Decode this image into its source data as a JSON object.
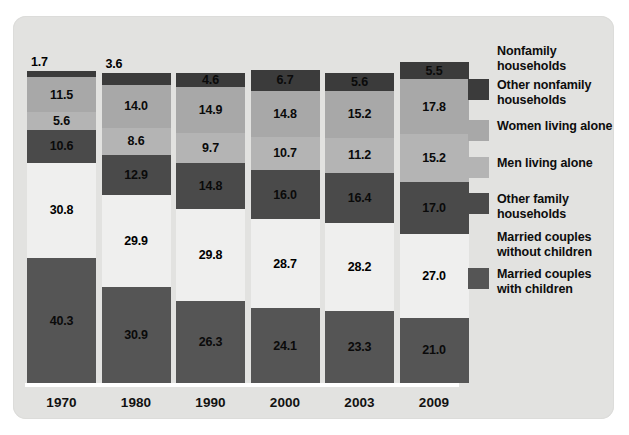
{
  "chart_data": {
    "type": "bar",
    "subtype": "stacked-bar-with-gap",
    "title": "",
    "xlabel": "",
    "ylabel": "",
    "grid": false,
    "legend_position": "right",
    "categories": [
      "1970",
      "1980",
      "1990",
      "2000",
      "2003",
      "2009"
    ],
    "series": [
      {
        "name": "Other nonfamily households",
        "color": "#3b3b3b",
        "values": [
          1.7,
          3.6,
          4.6,
          6.7,
          5.6,
          5.5
        ]
      },
      {
        "name": "Women living alone",
        "color": "#a8a8a8",
        "values": [
          11.5,
          14.0,
          14.9,
          14.8,
          15.2,
          17.8
        ]
      },
      {
        "name": "Men living alone",
        "color": "#b4b4b4",
        "values": [
          5.6,
          8.6,
          9.7,
          10.7,
          11.2,
          15.2
        ]
      },
      {
        "name": "Other family households",
        "color": "#4a4a4a",
        "values": [
          10.6,
          12.9,
          14.8,
          16.0,
          16.4,
          17.0
        ]
      },
      {
        "name": "Married couples without children",
        "color": "#efefee",
        "values": [
          30.8,
          29.9,
          29.8,
          28.7,
          28.2,
          27.0
        ]
      },
      {
        "name": "Married couples with children",
        "color": "#555555",
        "values": [
          40.3,
          30.9,
          26.3,
          24.1,
          23.3,
          21.0
        ]
      }
    ],
    "value_label_format": "one-decimal",
    "ylim": [
      0,
      100
    ]
  },
  "legend": {
    "items": [
      {
        "label": "Nonfamily\nhouseholds",
        "swatch": false,
        "color": ""
      },
      {
        "label": "Other nonfamily\nhouseholds",
        "swatch": true,
        "color": "#3b3b3b"
      },
      {
        "label": "Women living alone",
        "swatch": true,
        "color": "#a8a8a8"
      },
      {
        "label": "Men living alone",
        "swatch": true,
        "color": "#b4b4b4"
      },
      {
        "label": "Other family\nhouseholds",
        "swatch": true,
        "color": "#4a4a4a"
      },
      {
        "label": "Married couples\nwithout children",
        "swatch": false,
        "color": ""
      },
      {
        "label": "Married couples\nwith children",
        "swatch": true,
        "color": "#555555"
      }
    ]
  },
  "axis": {
    "ticks": [
      "1970",
      "1980",
      "1990",
      "2000",
      "2003",
      "2009"
    ],
    "line_color": "#ffffff"
  },
  "palette": {
    "panel_background": "#e2e2e0",
    "page_background": "#ffffff",
    "label_text": "#0d0d0d"
  }
}
